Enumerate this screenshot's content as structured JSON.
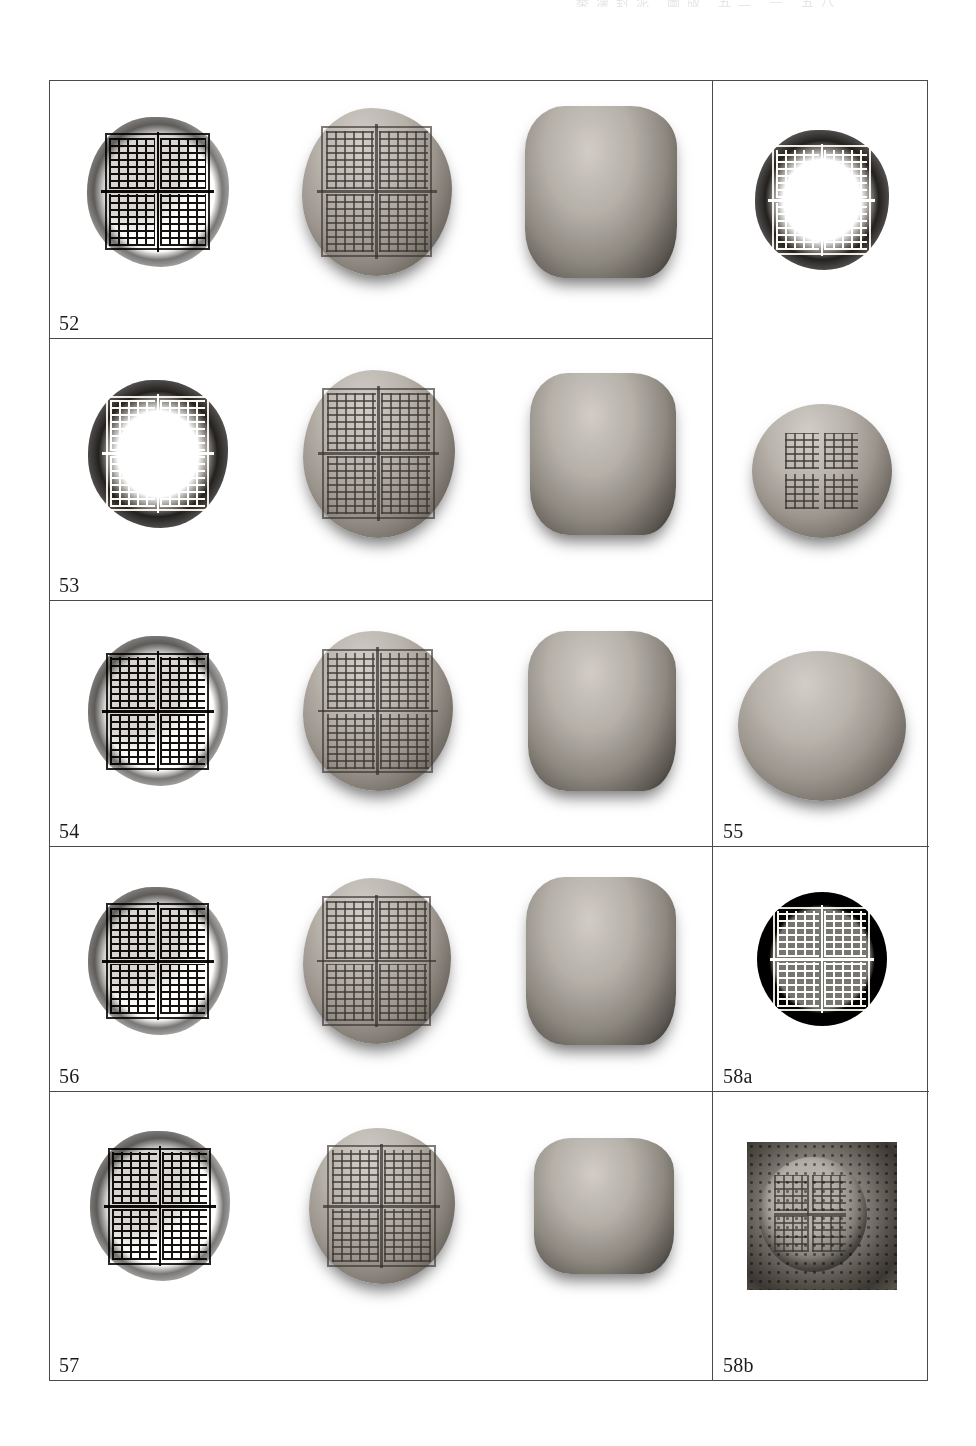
{
  "page": {
    "running_header": "秦漢封泥 圖版 五二 — 五八",
    "border_color": "#4a4a4a",
    "background": "#ffffff"
  },
  "plate": {
    "left_column": {
      "view_labels": [
        "impression-rubbing",
        "seal-face-photograph",
        "seal-side-photograph"
      ],
      "rows": [
        {
          "label": "52",
          "views": 3
        },
        {
          "label": "53",
          "views": 3
        },
        {
          "label": "54",
          "views": 3
        },
        {
          "label": "56",
          "views": 3
        },
        {
          "label": "57",
          "views": 3
        }
      ]
    },
    "right_column": {
      "cells": [
        {
          "label": "",
          "kind": "impression-rubbing"
        },
        {
          "label": "55",
          "kind": "seal-photograph"
        },
        {
          "label": "58a",
          "kind": "impression-rubbing"
        },
        {
          "label": "58b",
          "kind": "halftone-photograph"
        }
      ]
    }
  }
}
